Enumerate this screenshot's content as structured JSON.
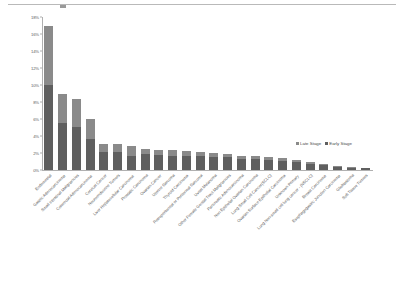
{
  "chart_data": {
    "type": "bar",
    "barmode": "stacked",
    "title": "",
    "xlabel": "",
    "ylabel": "",
    "ylim": [
      0,
      18
    ],
    "yunit": "%",
    "ytick_labels": [
      "18%",
      "16%",
      "14%",
      "12%",
      "10%",
      "8%",
      "6%",
      "4%",
      "2%",
      "0%"
    ],
    "ytick_values": [
      18,
      16,
      14,
      12,
      10,
      8,
      6,
      4,
      2,
      0
    ],
    "grid": false,
    "legend_position": "inside-right",
    "categories": [
      "Endometrial",
      "Gastric Adenocarcinoma",
      "Small Intestinal Malignancies",
      "Colorectal Adenocarcinoma",
      "Cervical Cancer",
      "Neuroendocrine Tumors",
      "Liver Hepatocellular Carcinoma",
      "Prostatic Carcinoma",
      "Ovarian Cancer",
      "Uterine Sarcoma",
      "Thyroid Carcinoma",
      "Retroperitoneal or Peritoneal Sarcoma",
      "Uveal Melanoma",
      "Other Female Genital Tract Malignancies",
      "Pancreatic Adenocarcinoma",
      "Non Epithelial Ovarian Carcinoma",
      "Lung Small Cell Cancer(SCLC)",
      "Ovarian Surface Epithelial Carcinoma",
      "Unknown Primary",
      "Lung Non-small cell lung cancer - (NSCLC)",
      "Breast Carcinoma",
      "Esophagogastric Junction Carcinoma",
      "Glioblastoma",
      "Soft Tissue Tumors"
    ],
    "series": [
      {
        "name": "Early Stage",
        "color": "#5f5f5f",
        "values": [
          10.0,
          5.5,
          5.1,
          3.6,
          2.1,
          2.1,
          1.7,
          1.9,
          1.8,
          1.7,
          1.6,
          1.6,
          1.5,
          1.5,
          1.3,
          1.3,
          1.2,
          1.1,
          0.9,
          0.7,
          0.55,
          0.35,
          0.25,
          0.2
        ]
      },
      {
        "name": "Late Stage",
        "color": "#8a8a8a",
        "values": [
          7.0,
          3.5,
          3.2,
          2.4,
          1.0,
          1.0,
          1.1,
          0.6,
          0.6,
          0.6,
          0.6,
          0.5,
          0.5,
          0.4,
          0.4,
          0.35,
          0.3,
          0.3,
          0.25,
          0.2,
          0.15,
          0.1,
          0.08,
          0.05
        ]
      }
    ],
    "totals": [
      17.0,
      9.0,
      8.3,
      6.0,
      3.1,
      3.1,
      2.8,
      2.5,
      2.4,
      2.3,
      2.2,
      2.1,
      2.0,
      1.9,
      1.7,
      1.65,
      1.5,
      1.4,
      1.15,
      0.9,
      0.7,
      0.45,
      0.33,
      0.25
    ]
  },
  "legend": {
    "items": [
      {
        "label": "Late Stage",
        "color": "#8a8a8a"
      },
      {
        "label": "Early Stage",
        "color": "#5f5f5f"
      }
    ]
  }
}
